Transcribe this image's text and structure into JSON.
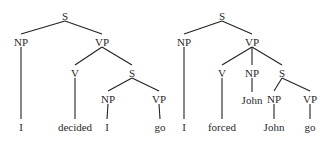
{
  "trees": [
    {
      "name": "tree-decided",
      "nodes": [
        {
          "id": "S1",
          "label": "S",
          "x": 65,
          "y": 16
        },
        {
          "id": "NP1",
          "label": "NP",
          "x": 21,
          "y": 42
        },
        {
          "id": "VP1",
          "label": "VP",
          "x": 102,
          "y": 42
        },
        {
          "id": "V1",
          "label": "V",
          "x": 75,
          "y": 73
        },
        {
          "id": "S2",
          "label": "S",
          "x": 132,
          "y": 73
        },
        {
          "id": "NP2",
          "label": "NP",
          "x": 108,
          "y": 99
        },
        {
          "id": "VP2",
          "label": "VP",
          "x": 159,
          "y": 99
        },
        {
          "id": "w1",
          "label": "I",
          "x": 21,
          "y": 127
        },
        {
          "id": "w2",
          "label": "decided",
          "x": 75,
          "y": 127
        },
        {
          "id": "w3",
          "label": "I",
          "x": 107,
          "y": 127
        },
        {
          "id": "w4",
          "label": "go",
          "x": 160,
          "y": 127
        }
      ],
      "edges": [
        [
          "S1",
          "NP1"
        ],
        [
          "S1",
          "VP1"
        ],
        [
          "NP1",
          "w1"
        ],
        [
          "VP1",
          "V1"
        ],
        [
          "VP1",
          "S2"
        ],
        [
          "V1",
          "w2"
        ],
        [
          "S2",
          "NP2"
        ],
        [
          "S2",
          "VP2"
        ],
        [
          "NP2",
          "w3"
        ],
        [
          "VP2",
          "w4"
        ]
      ]
    },
    {
      "name": "tree-forced",
      "nodes": [
        {
          "id": "S1",
          "label": "S",
          "x": 222,
          "y": 16
        },
        {
          "id": "NP1",
          "label": "NP",
          "x": 184,
          "y": 42
        },
        {
          "id": "VP1",
          "label": "VP",
          "x": 252,
          "y": 42
        },
        {
          "id": "V1",
          "label": "V",
          "x": 222,
          "y": 73
        },
        {
          "id": "NP2",
          "label": "NP",
          "x": 252,
          "y": 73
        },
        {
          "id": "S2",
          "label": "S",
          "x": 282,
          "y": 73
        },
        {
          "id": "w5",
          "label": "John",
          "x": 252,
          "y": 100
        },
        {
          "id": "NP3",
          "label": "NP",
          "x": 274,
          "y": 99
        },
        {
          "id": "VP2",
          "label": "VP",
          "x": 310,
          "y": 99
        },
        {
          "id": "w1",
          "label": "I",
          "x": 184,
          "y": 127
        },
        {
          "id": "w2",
          "label": "forced",
          "x": 222,
          "y": 127
        },
        {
          "id": "w3",
          "label": "John",
          "x": 274,
          "y": 127
        },
        {
          "id": "w4",
          "label": "go",
          "x": 310,
          "y": 127
        }
      ],
      "edges": [
        [
          "S1",
          "NP1"
        ],
        [
          "S1",
          "VP1"
        ],
        [
          "NP1",
          "w1"
        ],
        [
          "VP1",
          "V1"
        ],
        [
          "VP1",
          "NP2"
        ],
        [
          "VP1",
          "S2"
        ],
        [
          "V1",
          "w2"
        ],
        [
          "NP2",
          "w5"
        ],
        [
          "S2",
          "NP3"
        ],
        [
          "S2",
          "VP2"
        ],
        [
          "NP3",
          "w3"
        ],
        [
          "VP2",
          "w4"
        ]
      ]
    }
  ]
}
